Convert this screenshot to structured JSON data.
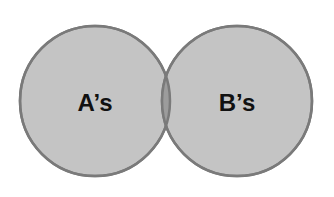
{
  "diagram": {
    "type": "venn",
    "sets": [
      {
        "label": "A’s",
        "fill": "#c4c4c4",
        "stroke": "#7a7a7a"
      },
      {
        "label": "B’s",
        "fill": "#c4c4c4",
        "stroke": "#7a7a7a"
      }
    ],
    "intersection": {
      "fill": "#9a9a9a"
    }
  }
}
